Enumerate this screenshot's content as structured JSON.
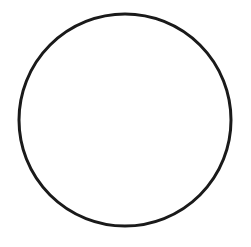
{
  "shape": {
    "type": "circle",
    "cx": 125,
    "cy": 120,
    "r": 106,
    "stroke": "#1a1a1a",
    "stroke_width": 3,
    "fill": "#ffffff"
  },
  "canvas": {
    "width": 251,
    "height": 247,
    "background": "#ffffff"
  }
}
